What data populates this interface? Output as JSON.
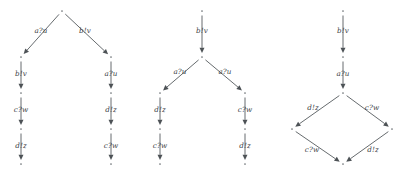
{
  "figure": {
    "type": "directed-graph-diagram",
    "background_color": "#ffffff",
    "edge_color": "#555a5e",
    "node_color": "#6b7074",
    "label_color": "#3d4246",
    "graphs": [
      {
        "id": "graph-1",
        "name": "branching-tree-left",
        "nodes": [
          {
            "id": "g1n0",
            "x": 62,
            "y": 11
          },
          {
            "id": "g1n1",
            "x": 21,
            "y": 57
          },
          {
            "id": "g1n2",
            "x": 111,
            "y": 57
          },
          {
            "id": "g1n3",
            "x": 21,
            "y": 93
          },
          {
            "id": "g1n4",
            "x": 111,
            "y": 93
          },
          {
            "id": "g1n5",
            "x": 21,
            "y": 129
          },
          {
            "id": "g1n6",
            "x": 111,
            "y": 129
          },
          {
            "id": "g1n7",
            "x": 21,
            "y": 164
          },
          {
            "id": "g1n8",
            "x": 111,
            "y": 164
          }
        ],
        "edges": [
          {
            "from": "g1n0",
            "to": "g1n1",
            "label": "a?u",
            "lx": 41,
            "ly": 31
          },
          {
            "from": "g1n0",
            "to": "g1n2",
            "label": "b!v",
            "lx": 85,
            "ly": 31
          },
          {
            "from": "g1n1",
            "to": "g1n3",
            "label": "b!v",
            "lx": 21,
            "ly": 74
          },
          {
            "from": "g1n2",
            "to": "g1n4",
            "label": "a?u",
            "lx": 111,
            "ly": 74
          },
          {
            "from": "g1n3",
            "to": "g1n5",
            "label": "c?w",
            "lx": 21,
            "ly": 110
          },
          {
            "from": "g1n4",
            "to": "g1n6",
            "label": "d!z",
            "lx": 111,
            "ly": 110
          },
          {
            "from": "g1n5",
            "to": "g1n7",
            "label": "d!z",
            "lx": 21,
            "ly": 146
          },
          {
            "from": "g1n6",
            "to": "g1n8",
            "label": "c?w",
            "lx": 111,
            "ly": 146
          }
        ]
      },
      {
        "id": "graph-2",
        "name": "branching-tree-middle",
        "nodes": [
          {
            "id": "g2n0",
            "x": 202,
            "y": 11
          },
          {
            "id": "g2n1",
            "x": 202,
            "y": 57
          },
          {
            "id": "g2n2",
            "x": 160,
            "y": 93
          },
          {
            "id": "g2n3",
            "x": 245,
            "y": 93
          },
          {
            "id": "g2n4",
            "x": 160,
            "y": 129
          },
          {
            "id": "g2n5",
            "x": 245,
            "y": 129
          },
          {
            "id": "g2n6",
            "x": 160,
            "y": 164
          },
          {
            "id": "g2n7",
            "x": 245,
            "y": 164
          }
        ],
        "edges": [
          {
            "from": "g2n0",
            "to": "g2n1",
            "label": "b!v",
            "lx": 202,
            "ly": 31
          },
          {
            "from": "g2n1",
            "to": "g2n2",
            "label": "a?u",
            "lx": 180,
            "ly": 72
          },
          {
            "from": "g2n1",
            "to": "g2n3",
            "label": "a?u",
            "lx": 225,
            "ly": 72
          },
          {
            "from": "g2n2",
            "to": "g2n4",
            "label": "d!z",
            "lx": 160,
            "ly": 110
          },
          {
            "from": "g2n3",
            "to": "g2n5",
            "label": "c?w",
            "lx": 245,
            "ly": 110
          },
          {
            "from": "g2n4",
            "to": "g2n6",
            "label": "c?w",
            "lx": 160,
            "ly": 146
          },
          {
            "from": "g2n5",
            "to": "g2n7",
            "label": "d!z",
            "lx": 245,
            "ly": 146
          }
        ]
      },
      {
        "id": "graph-3",
        "name": "diamond-graph-right",
        "nodes": [
          {
            "id": "g3n0",
            "x": 343,
            "y": 11
          },
          {
            "id": "g3n1",
            "x": 343,
            "y": 57
          },
          {
            "id": "g3n2",
            "x": 343,
            "y": 93
          },
          {
            "id": "g3n3",
            "x": 292,
            "y": 129
          },
          {
            "id": "g3n4",
            "x": 392,
            "y": 129
          },
          {
            "id": "g3n5",
            "x": 343,
            "y": 164
          }
        ],
        "edges": [
          {
            "from": "g3n0",
            "to": "g3n1",
            "label": "b!v",
            "lx": 343,
            "ly": 31
          },
          {
            "from": "g3n1",
            "to": "g3n2",
            "label": "a?u",
            "lx": 343,
            "ly": 74
          },
          {
            "from": "g3n2",
            "to": "g3n3",
            "label": "d!z",
            "lx": 313,
            "ly": 108
          },
          {
            "from": "g3n2",
            "to": "g3n4",
            "label": "c?w",
            "lx": 372,
            "ly": 108
          },
          {
            "from": "g3n3",
            "to": "g3n5",
            "label": "c?w",
            "lx": 312,
            "ly": 150
          },
          {
            "from": "g3n4",
            "to": "g3n5",
            "label": "d!z",
            "lx": 373,
            "ly": 150
          }
        ]
      }
    ]
  }
}
